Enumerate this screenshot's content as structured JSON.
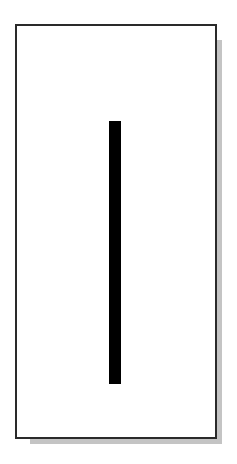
{
  "figure": {
    "background": "#ffffff",
    "card": {
      "fill": "#ffffff",
      "border_color": "#2a2a2a",
      "shadow_color": "#c4c4c4"
    },
    "bar": {
      "orientation": "vertical",
      "color": "#000000"
    }
  }
}
